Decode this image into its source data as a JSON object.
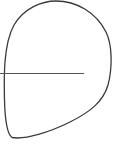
{
  "diagram": {
    "stroke_color": "#3a3a3a",
    "line_color": "#555555",
    "shape": {
      "kind": "closed-curve",
      "top": [
        55,
        1
      ],
      "right": [
        111,
        60
      ],
      "bottom_left_corner": [
        12,
        138
      ],
      "left": [
        4,
        73
      ]
    },
    "horizontal_line": {
      "x1": 0,
      "y1": 73.5,
      "x2": 84,
      "y2": 73.5
    }
  }
}
